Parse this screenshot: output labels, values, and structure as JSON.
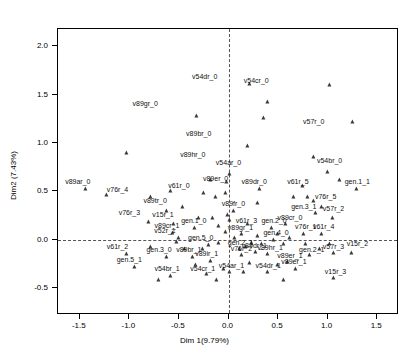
{
  "chart_data": {
    "type": "scatter",
    "title": "",
    "xlabel": "Dim 1(9.79%)",
    "ylabel": "Dim2 (7.43%)",
    "xlim": [
      -1.72,
      1.72
    ],
    "ylim": [
      -0.78,
      2.18
    ],
    "xticks": [
      -1.5,
      -1.0,
      -0.5,
      0.0,
      0.5,
      1.0,
      1.5
    ],
    "xticklabels": [
      "-1.5",
      "-1.0",
      "-0.5",
      "0.0",
      "0.5",
      "1.0",
      "1.5"
    ],
    "yticks": [
      -0.5,
      0.0,
      0.5,
      1.0,
      1.5,
      2.0
    ],
    "yticklabels": [
      "-0.5",
      "0.0",
      "0.5",
      "1.0",
      "1.5",
      "2.0"
    ],
    "grid": false,
    "legend": null,
    "reference_lines": {
      "vertical_x": 0.0,
      "horizontal_y": 0.0,
      "style": "dashed"
    },
    "marker": "triangle",
    "marker_color": "#3a3a3a",
    "points": [
      {
        "label": "v54dr_0",
        "x": 0.22,
        "y": 1.61,
        "lx": -0.24,
        "ly": 1.61
      },
      {
        "label": "v89gr_0",
        "x": -0.32,
        "y": 1.28,
        "lx": -0.84,
        "ly": 1.33
      },
      {
        "label": "v57r_0",
        "x": 1.26,
        "y": 1.22,
        "lx": 0.86,
        "ly": 1.14
      },
      {
        "label": "v54cr_0",
        "x": 0.4,
        "y": 1.42,
        "lx": 0.28,
        "ly": 1.57
      },
      {
        "label": "v89br_0",
        "x": 0.2,
        "y": 0.97,
        "lx": -0.3,
        "ly": 1.02
      },
      {
        "label": "v89hr_0",
        "x": -1.02,
        "y": 0.9,
        "lx": -0.36,
        "ly": 0.8
      },
      {
        "label": "v54br_0",
        "x": 1.0,
        "y": 0.7,
        "lx": 1.02,
        "ly": 0.74
      },
      {
        "label": "v89ar_0",
        "x": -1.44,
        "y": 0.52,
        "lx": -1.52,
        "ly": 0.52
      },
      {
        "label": "v76r_4",
        "x": -0.78,
        "y": 0.44,
        "lx": -1.12,
        "ly": 0.44
      },
      {
        "label": "v61r_0",
        "x": -0.25,
        "y": 0.48,
        "lx": -0.5,
        "ly": 0.48
      },
      {
        "label": "v89er_0",
        "x": -0.03,
        "y": 0.48,
        "lx": -0.13,
        "ly": 0.55
      },
      {
        "label": "v89dr_0",
        "x": 0.32,
        "y": 0.52,
        "lx": 0.26,
        "ly": 0.52
      },
      {
        "label": "v61r_5",
        "x": 0.75,
        "y": 0.56,
        "lx": 0.7,
        "ly": 0.52
      },
      {
        "label": "gen.1_1",
        "x": 1.3,
        "y": 0.52,
        "lx": 1.3,
        "ly": 0.52
      },
      {
        "label": "v76r_5",
        "x": 0.86,
        "y": 0.4,
        "lx": 0.98,
        "ly": 0.37
      },
      {
        "label": "v89tr_0",
        "x": -0.62,
        "y": 0.3,
        "lx": -0.74,
        "ly": 0.33
      },
      {
        "label": "v76r_3",
        "x": -0.8,
        "y": 0.18,
        "lx": -1.0,
        "ly": 0.2
      },
      {
        "label": "v15r_1",
        "x": -0.55,
        "y": 0.16,
        "lx": -0.66,
        "ly": 0.18
      },
      {
        "label": "gen.1_0",
        "x": -0.34,
        "y": 0.12,
        "lx": -0.35,
        "ly": 0.12
      },
      {
        "label": "v61r_3",
        "x": 0.2,
        "y": 0.16,
        "lx": 0.18,
        "ly": 0.12
      },
      {
        "label": "gen.2_0",
        "x": 0.44,
        "y": 0.12,
        "lx": 0.46,
        "ly": 0.12
      },
      {
        "label": "gen.3_1",
        "x": 0.88,
        "y": 0.28,
        "lx": 0.76,
        "ly": 0.27
      },
      {
        "label": "v57r_2",
        "x": 1.05,
        "y": 0.22,
        "lx": 1.06,
        "ly": 0.24
      },
      {
        "label": "v89cr_0",
        "x": 0.58,
        "y": 0.16,
        "lx": 0.62,
        "ly": 0.15
      },
      {
        "label": "v76r_1",
        "x": 0.76,
        "y": 0.06,
        "lx": 0.78,
        "ly": 0.06
      },
      {
        "label": "v61r_4",
        "x": 0.94,
        "y": 0.06,
        "lx": 0.96,
        "ly": 0.06
      },
      {
        "label": "v89cr_1",
        "x": -0.56,
        "y": 0.07,
        "lx": -0.62,
        "ly": 0.07
      },
      {
        "label": "v52r_1",
        "x": -0.5,
        "y": 0.02,
        "lx": -0.64,
        "ly": 0.02
      },
      {
        "label": "v89fr_0",
        "x": -0.01,
        "y": 0.26,
        "lx": 0.05,
        "ly": 0.3
      },
      {
        "label": "v89gr_1",
        "x": 0.14,
        "y": 0.06,
        "lx": 0.12,
        "ly": 0.05
      },
      {
        "label": "gen.4_0",
        "x": 0.46,
        "y": 0.0,
        "lx": 0.48,
        "ly": 0.0
      },
      {
        "label": "gen.5_0",
        "x": -0.2,
        "y": -0.06,
        "lx": -0.28,
        "ly": -0.06
      },
      {
        "label": "gen.2_1",
        "x": 0.12,
        "y": -0.1,
        "lx": 0.12,
        "ly": -0.11
      },
      {
        "label": "v61r_2",
        "x": -1.02,
        "y": -0.15,
        "lx": -1.12,
        "ly": -0.15
      },
      {
        "label": "gen.3_0",
        "x": -0.62,
        "y": -0.18,
        "lx": -0.7,
        "ly": -0.18
      },
      {
        "label": "v89br_1",
        "x": -0.36,
        "y": -0.18,
        "lx": -0.4,
        "ly": -0.18
      },
      {
        "label": "v89ir_1",
        "x": -0.18,
        "y": -0.22,
        "lx": -0.22,
        "ly": -0.22
      },
      {
        "label": "v89dr_1",
        "x": 0.28,
        "y": -0.13,
        "lx": 0.26,
        "ly": -0.14
      },
      {
        "label": "v76r_2",
        "x": 0.14,
        "y": -0.16,
        "lx": 0.13,
        "ly": -0.17
      },
      {
        "label": "v89hr_1",
        "x": 0.4,
        "y": -0.15,
        "lx": 0.42,
        "ly": -0.16
      },
      {
        "label": "gen.2_1b",
        "x": 0.82,
        "y": -0.16,
        "lx": 0.84,
        "ly": -0.18
      },
      {
        "label": "v15r_2",
        "x": 1.25,
        "y": -0.14,
        "lx": 1.3,
        "ly": -0.12
      },
      {
        "label": "v57r_3",
        "x": 1.06,
        "y": -0.14,
        "lx": 1.06,
        "ly": -0.15
      },
      {
        "label": "v89er_1",
        "x": 0.6,
        "y": -0.23,
        "lx": 0.62,
        "ly": -0.24
      },
      {
        "label": "gen.5_1",
        "x": -0.94,
        "y": -0.28,
        "lx": -1.0,
        "ly": -0.28
      },
      {
        "label": "v54br_1",
        "x": -0.58,
        "y": -0.38,
        "lx": -0.62,
        "ly": -0.38
      },
      {
        "label": "v54cr_1",
        "x": -0.22,
        "y": -0.36,
        "lx": -0.26,
        "ly": -0.38
      },
      {
        "label": "v54ar_1",
        "x": 0.02,
        "y": -0.34,
        "lx": 0.03,
        "ly": -0.35
      },
      {
        "label": "v54dr_1",
        "x": 0.4,
        "y": -0.34,
        "lx": 0.4,
        "ly": -0.35
      },
      {
        "label": "v15r_3",
        "x": 1.06,
        "y": -0.4,
        "lx": 1.08,
        "ly": -0.41
      },
      {
        "label": "v89er_1b",
        "x": 0.68,
        "y": -0.3,
        "lx": 0.66,
        "ly": -0.3
      },
      {
        "label": "v54ar_0",
        "x": 0.02,
        "y": 0.68,
        "lx": 0.0,
        "ly": 0.72
      },
      {
        "label": "",
        "x": -0.02,
        "y": 0.6,
        "lx": null,
        "ly": null
      },
      {
        "label": "",
        "x": -0.18,
        "y": 0.62,
        "lx": null,
        "ly": null
      },
      {
        "label": "",
        "x": -0.46,
        "y": 0.34,
        "lx": null,
        "ly": null
      },
      {
        "label": "",
        "x": -0.3,
        "y": 0.22,
        "lx": null,
        "ly": null
      },
      {
        "label": "",
        "x": -0.16,
        "y": 0.22,
        "lx": null,
        "ly": null
      },
      {
        "label": "",
        "x": -0.1,
        "y": 0.14,
        "lx": null,
        "ly": null
      },
      {
        "label": "",
        "x": 0.02,
        "y": 0.2,
        "lx": null,
        "ly": null
      },
      {
        "label": "",
        "x": 0.06,
        "y": 0.3,
        "lx": null,
        "ly": null
      },
      {
        "label": "",
        "x": 0.3,
        "y": 0.38,
        "lx": null,
        "ly": null
      },
      {
        "label": "",
        "x": 0.66,
        "y": 0.44,
        "lx": null,
        "ly": null
      },
      {
        "label": "",
        "x": 0.8,
        "y": 0.44,
        "lx": null,
        "ly": null
      },
      {
        "label": "",
        "x": 0.94,
        "y": 0.34,
        "lx": null,
        "ly": null
      },
      {
        "label": "",
        "x": -0.03,
        "y": 0.08,
        "lx": null,
        "ly": null
      },
      {
        "label": "",
        "x": 0.07,
        "y": 0.02,
        "lx": null,
        "ly": null
      },
      {
        "label": "",
        "x": 0.3,
        "y": 0.04,
        "lx": null,
        "ly": null
      },
      {
        "label": "",
        "x": 0.5,
        "y": 0.06,
        "lx": null,
        "ly": null
      },
      {
        "label": "",
        "x": 0.62,
        "y": 0.02,
        "lx": null,
        "ly": null
      },
      {
        "label": "",
        "x": -0.52,
        "y": -0.02,
        "lx": null,
        "ly": null
      },
      {
        "label": "",
        "x": -0.1,
        "y": -0.03,
        "lx": null,
        "ly": null
      },
      {
        "label": "",
        "x": 0.24,
        "y": -0.03,
        "lx": null,
        "ly": null
      },
      {
        "label": "",
        "x": 0.34,
        "y": -0.04,
        "lx": null,
        "ly": null
      },
      {
        "label": "",
        "x": 0.56,
        "y": -0.04,
        "lx": null,
        "ly": null
      },
      {
        "label": "",
        "x": 0.78,
        "y": -0.04,
        "lx": null,
        "ly": null
      },
      {
        "label": "",
        "x": 1.02,
        "y": -0.04,
        "lx": null,
        "ly": null
      },
      {
        "label": "",
        "x": -0.78,
        "y": -0.08,
        "lx": null,
        "ly": null
      },
      {
        "label": "",
        "x": -0.44,
        "y": -0.1,
        "lx": null,
        "ly": null
      },
      {
        "label": "",
        "x": -0.26,
        "y": -0.1,
        "lx": null,
        "ly": null
      },
      {
        "label": "",
        "x": 0.18,
        "y": -0.08,
        "lx": null,
        "ly": null
      },
      {
        "label": "",
        "x": 0.92,
        "y": -0.1,
        "lx": null,
        "ly": null
      },
      {
        "label": "",
        "x": -0.33,
        "y": -0.26,
        "lx": null,
        "ly": null
      },
      {
        "label": "",
        "x": 0.22,
        "y": -0.24,
        "lx": null,
        "ly": null
      },
      {
        "label": "",
        "x": 0.5,
        "y": -0.26,
        "lx": null,
        "ly": null
      },
      {
        "label": "",
        "x": -0.05,
        "y": -0.3,
        "lx": null,
        "ly": null
      },
      {
        "label": "",
        "x": -0.7,
        "y": -0.42,
        "lx": null,
        "ly": null
      },
      {
        "label": "",
        "x": -0.12,
        "y": -0.42,
        "lx": null,
        "ly": null
      },
      {
        "label": "",
        "x": 0.56,
        "y": -0.42,
        "lx": null,
        "ly": null
      },
      {
        "label": "",
        "x": -1.23,
        "y": 0.46,
        "lx": null,
        "ly": null
      },
      {
        "label": "",
        "x": 1.12,
        "y": 0.62,
        "lx": null,
        "ly": null
      },
      {
        "label": "",
        "x": -0.58,
        "y": 0.5,
        "lx": null,
        "ly": null
      },
      {
        "label": "",
        "x": 0.86,
        "y": 0.86,
        "lx": null,
        "ly": null
      },
      {
        "label": "",
        "x": 0.36,
        "y": 1.26,
        "lx": null,
        "ly": null
      },
      {
        "label": "",
        "x": 1.02,
        "y": 1.6,
        "lx": null,
        "ly": null
      },
      {
        "label": "",
        "x": -0.13,
        "y": 0.44,
        "lx": null,
        "ly": null
      },
      {
        "label": "",
        "x": 0.16,
        "y": -0.34,
        "lx": null,
        "ly": null
      }
    ]
  }
}
